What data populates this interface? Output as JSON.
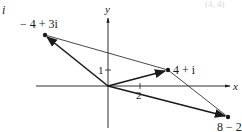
{
  "figure": {
    "corner_label": "i",
    "faint_top_label": "(4, 4)",
    "axes": {
      "x_label": "x",
      "y_label": "y",
      "x_tick_label": "2",
      "y_tick_label": "1"
    },
    "points": [
      {
        "label": "− 4 + 3i",
        "re": -4,
        "im": 3
      },
      {
        "label": "4 + i",
        "re": 4,
        "im": 1
      },
      {
        "label": "8 − 2",
        "re": 8,
        "im": -2
      }
    ],
    "vectors": [
      {
        "from": "origin",
        "to": "− 4 + 3i",
        "arrow": true
      },
      {
        "from": "origin",
        "to": "4 + i",
        "arrow": true
      },
      {
        "from": "origin",
        "to": "8 − 2i",
        "arrow": true
      },
      {
        "from": "− 4 + 3i",
        "to": "4 + i",
        "arrow": false
      },
      {
        "from": "4 + i",
        "to": "8 − 2i",
        "arrow": false
      }
    ],
    "colors": {
      "ink": "#1a1a1a",
      "background": "#ffffff"
    }
  }
}
